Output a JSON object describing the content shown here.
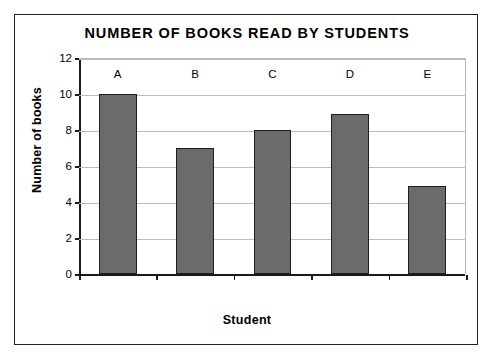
{
  "scan": {
    "top_artifact_text": ""
  },
  "chart_data": {
    "type": "bar",
    "title": "NUMBER OF BOOKS READ BY STUDENTS",
    "xlabel": "Student",
    "ylabel": "Number of books",
    "categories": [
      "A",
      "B",
      "C",
      "D",
      "E"
    ],
    "values": [
      10,
      7,
      8,
      8.9,
      4.9
    ],
    "ylim": [
      0,
      12
    ],
    "yticks": [
      0,
      2,
      4,
      6,
      8,
      10,
      12
    ],
    "ytick_labels": [
      "0",
      "2",
      "4",
      "6",
      "8",
      "10",
      "12"
    ],
    "grid": true,
    "legend": false,
    "bar_color": "#6b6b6b",
    "bar_edge_color": "#1f1f1f",
    "gridline_color": "#bdbdbd",
    "axis_color": "#1a1a1a",
    "frame_color": "#222222"
  }
}
